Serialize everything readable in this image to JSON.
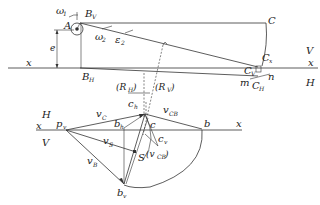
{
  "diagram": {
    "type": "descriptive-geometry kinematic construction",
    "upper_view": {
      "labels": {
        "omega1": "ω",
        "omega1_sub": "1",
        "A": "A",
        "BV": "B",
        "BV_sub": "V",
        "e": "e",
        "omega2": "ω",
        "omega2_sub": "2",
        "eps2": "ε",
        "eps2_sub": "2",
        "C": "C",
        "Cx": "C",
        "Cx_sub": "x",
        "CV": "C",
        "CV_sub": "V",
        "CH": "C",
        "CH_sub": "H",
        "m": "m",
        "n": "n",
        "BH": "B",
        "BH_sub": "H",
        "x_left": "x",
        "x_right": "x",
        "V": "V",
        "H": "H",
        "RH": "(R",
        "RH_sub": "H",
        "RH_close": ")",
        "RV": "(R",
        "RV_sub": "V",
        "RV_close": ")"
      }
    },
    "lower_view": {
      "labels": {
        "H": "H",
        "V": "V",
        "x_left": "x",
        "x_right": "x",
        "pv": "p",
        "pv_sub": "v",
        "vC": "v",
        "vC_sub": "C",
        "ch": "c",
        "ch_sub": "h",
        "bh": "b",
        "bh_sub": "h",
        "c": "c",
        "cv": "c",
        "cv_sub": "v",
        "vCB": "v",
        "vCB_sub": "CB",
        "b": "b",
        "vS": "v",
        "vS_sub": "S",
        "S": "S",
        "vCB_paren": "(v",
        "vCB_paren_sub": "CB",
        "vCB_paren_close": ")",
        "vB": "v",
        "vB_sub": "B",
        "bv": "b",
        "bv_sub": "v"
      }
    }
  }
}
